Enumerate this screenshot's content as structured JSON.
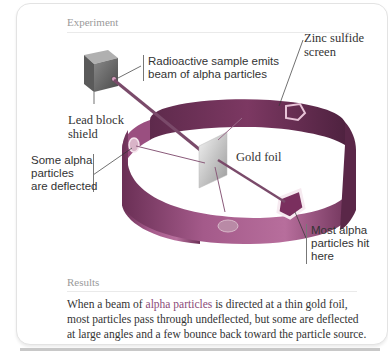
{
  "figure": {
    "experiment_heading": "Experiment",
    "results_heading": "Results",
    "labels": {
      "source": [
        "Radioactive sample emits",
        "beam of alpha particles"
      ],
      "lead_block": [
        "Lead block",
        "shield"
      ],
      "zinc_screen": [
        "Zinc sulfide",
        "screen"
      ],
      "gold_foil": "Gold foil",
      "deflected": [
        "Some alpha",
        "particles",
        "are deflected"
      ],
      "most_hit": [
        "Most alpha",
        "particles hit",
        "here"
      ]
    },
    "results_text": {
      "part1": "When a beam of ",
      "highlight": "alpha particles",
      "part2": " is directed at a thin gold foil, most particles pass through undeflected, but some are deflected at large angles and a few bounce back toward the particle source."
    },
    "colors": {
      "screen": "#8a3e6e",
      "screen_light": "#c98fb3",
      "beam": "#7a4a6a",
      "highlight_text": "#8a4a78"
    }
  }
}
